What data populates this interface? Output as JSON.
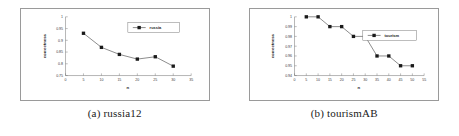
{
  "figure": {
    "panels": [
      {
        "caption": "(a) russia12",
        "legend_label": "russia",
        "xlabel": "n",
        "ylabel": "correctness",
        "y_ticks": [
          "1",
          "0.95",
          "0.9",
          "0.85",
          "0.8",
          "0.75"
        ],
        "x_ticks": [
          "0",
          "5",
          "10",
          "15",
          "20",
          "25",
          "30",
          "35"
        ]
      },
      {
        "caption": "(b) tourismAB",
        "legend_label": "tourism",
        "xlabel": "n",
        "ylabel": "correctness",
        "y_ticks": [
          "1",
          "0.99",
          "0.98",
          "0.97",
          "0.96",
          "0.95",
          "0.94"
        ],
        "x_ticks": [
          "0",
          "5",
          "10",
          "15",
          "20",
          "25",
          "30",
          "35",
          "40",
          "45",
          "50",
          "55"
        ]
      }
    ]
  },
  "colors": {
    "line": "#2b2b2b",
    "marker": "#1a1a1a",
    "axis": "#6a6a6a",
    "frame": "#9a9a9a",
    "background": "#ffffff"
  },
  "chart_data": [
    {
      "type": "line",
      "title": "(a) russia12",
      "xlabel": "n",
      "ylabel": "correctness",
      "xlim": [
        0,
        35
      ],
      "ylim": [
        0.75,
        1
      ],
      "xticks": [
        0,
        5,
        10,
        15,
        20,
        25,
        30,
        35
      ],
      "yticks": [
        0.75,
        0.8,
        0.85,
        0.9,
        0.95,
        1
      ],
      "grid": false,
      "legend_position": "top-right",
      "series": [
        {
          "name": "russia",
          "x": [
            5,
            10,
            15,
            20,
            25,
            30
          ],
          "values": [
            0.93,
            0.87,
            0.84,
            0.82,
            0.83,
            0.79
          ]
        }
      ]
    },
    {
      "type": "line",
      "title": "(b) tourismAB",
      "xlabel": "n",
      "ylabel": "correctness",
      "xlim": [
        0,
        55
      ],
      "ylim": [
        0.94,
        1
      ],
      "xticks": [
        0,
        5,
        10,
        15,
        20,
        25,
        30,
        35,
        40,
        45,
        50,
        55
      ],
      "yticks": [
        0.94,
        0.95,
        0.96,
        0.97,
        0.98,
        0.99,
        1
      ],
      "grid": false,
      "legend_position": "right",
      "series": [
        {
          "name": "tourism",
          "x": [
            5,
            10,
            15,
            20,
            25,
            30,
            35,
            40,
            45,
            50
          ],
          "values": [
            1.0,
            1.0,
            0.99,
            0.99,
            0.98,
            0.98,
            0.96,
            0.96,
            0.95,
            0.95
          ]
        }
      ]
    }
  ]
}
